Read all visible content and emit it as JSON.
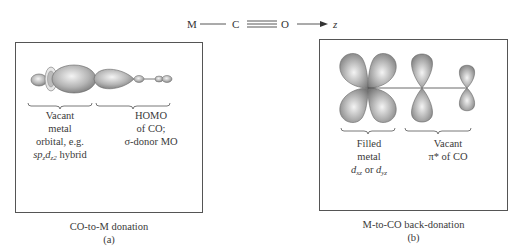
{
  "axis_header": {
    "atom_m": "M",
    "atom_c": "C",
    "atom_o": "O",
    "axis_label": "z"
  },
  "panel_a": {
    "orbital_metal_label": [
      "Vacant",
      "metal",
      "orbital, e.g."
    ],
    "orbital_metal_hybrid": {
      "sp": "sp",
      "sub1": "z",
      "d": "d",
      "sub2": "z2",
      "rest": " hybrid"
    },
    "orbital_co_label": [
      "HOMO",
      "of CO;",
      "σ-donor MO"
    ],
    "caption": "CO-to-M donation",
    "sub_caption": "(a)"
  },
  "panel_b": {
    "orbital_metal_label": [
      "Filled",
      "metal"
    ],
    "orbital_metal_d": {
      "d1": "d",
      "sub1": "xz",
      "or": " or ",
      "d2": "d",
      "sub2": "yz"
    },
    "orbital_co_label": [
      "Vacant",
      "π* of CO"
    ],
    "caption": "M-to-CO back-donation",
    "sub_caption": "(b)"
  },
  "colors": {
    "lobe": "#8a8a8a",
    "lobe_highlight": "#f2f2f2",
    "line": "#444444",
    "border": "#555555"
  }
}
